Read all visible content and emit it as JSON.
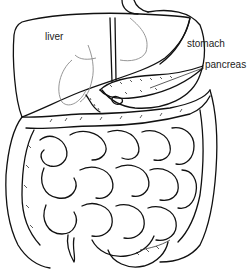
{
  "diagram": {
    "labels": [
      {
        "id": "liver",
        "text": "liver"
      },
      {
        "id": "stomach",
        "text": "stomach"
      },
      {
        "id": "pancreas",
        "text": "pancreas"
      }
    ],
    "colors": {
      "stroke": "#111111",
      "background": "#ffffff",
      "faint": "#8a8a8a"
    }
  }
}
